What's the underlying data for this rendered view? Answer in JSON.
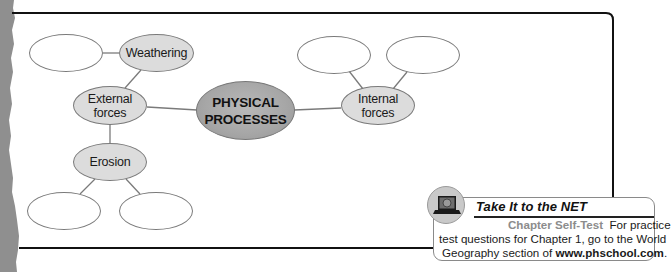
{
  "diagram": {
    "type": "concept-web",
    "center": {
      "label_line1": "PHYSICAL",
      "label_line2": "PROCESSES"
    },
    "nodes": {
      "external_forces": {
        "line1": "External",
        "line2": "forces"
      },
      "internal_forces": {
        "line1": "Internal",
        "line2": "forces"
      },
      "weathering": {
        "label": "Weathering"
      },
      "erosion": {
        "label": "Erosion"
      },
      "blank_weathering": {
        "label": ""
      },
      "blank_erosion_left": {
        "label": ""
      },
      "blank_erosion_right": {
        "label": ""
      },
      "blank_internal_left": {
        "label": ""
      },
      "blank_internal_right": {
        "label": ""
      }
    },
    "colors": {
      "center_fill": "#a6a6a6",
      "sub_fill": "#dcdcdc",
      "empty_fill": "#ffffff",
      "stroke": "#7a7a7a",
      "frame": "#111111"
    }
  },
  "net_box": {
    "title": "Take It to the NET",
    "subtitle": "Chapter Self-Test",
    "line1_rest": "For practice",
    "line2": "test questions for Chapter 1, go to the World",
    "line3_pre": "Geography section of ",
    "line3_link": "www.phschool.com",
    "line3_post": ".",
    "icon": "laptop-globe-icon"
  }
}
